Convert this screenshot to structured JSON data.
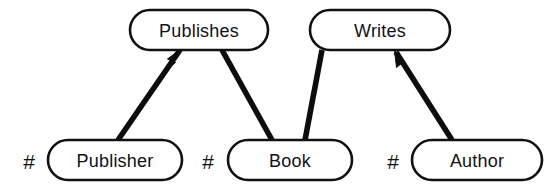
{
  "diagram": {
    "background_color": "#ffffff",
    "line_color": "#0d0d0d",
    "text_color": "#121212",
    "border_color": "#111111",
    "entities": [
      {
        "id": "publisher",
        "label": "Publisher",
        "key_marker": "#",
        "row": "bottom",
        "cx": 115,
        "cy": 160,
        "width": 134,
        "height": 40,
        "marker_x": 29
      },
      {
        "id": "book",
        "label": "Book",
        "key_marker": "#",
        "row": "bottom",
        "cx": 290,
        "cy": 160,
        "width": 124,
        "height": 40,
        "marker_x": 208
      },
      {
        "id": "author",
        "label": "Author",
        "key_marker": "#",
        "row": "bottom",
        "cx": 477,
        "cy": 160,
        "width": 130,
        "height": 40,
        "marker_x": 393
      }
    ],
    "relationships": [
      {
        "id": "publishes",
        "label": "Publishes",
        "row": "top",
        "cx": 199,
        "cy": 30,
        "width": 138,
        "height": 40
      },
      {
        "id": "writes",
        "label": "Writes",
        "row": "top",
        "cx": 380,
        "cy": 30,
        "width": 140,
        "height": 40
      }
    ],
    "edges": [
      {
        "id": "publisher-to-publishes",
        "from": "publisher",
        "to": "publishes",
        "from_x": 118,
        "from_y": 140,
        "to_x": 180,
        "to_y": 50,
        "arrowhead": "at-target"
      },
      {
        "id": "publishes-to-book",
        "from": "publishes",
        "to": "book",
        "from_x": 222,
        "from_y": 50,
        "to_x": 272,
        "to_y": 140,
        "arrowhead": "none"
      },
      {
        "id": "book-to-writes",
        "from": "book",
        "to": "writes",
        "from_x": 305,
        "from_y": 140,
        "to_x": 322,
        "to_y": 50,
        "arrowhead": "none"
      },
      {
        "id": "author-to-writes",
        "from": "author",
        "to": "writes",
        "from_x": 452,
        "from_y": 140,
        "to_x": 396,
        "to_y": 52,
        "arrowhead": "at-target"
      }
    ]
  }
}
